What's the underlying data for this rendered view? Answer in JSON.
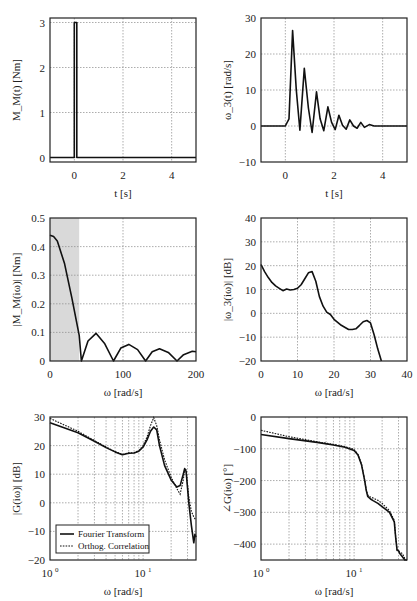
{
  "chart_data": [
    {
      "id": "torque-time",
      "type": "line",
      "xlabel": "t [s]",
      "ylabel": "M_M(t) [Nm]",
      "xlim": [
        -1,
        5
      ],
      "ylim": [
        -0.1,
        3.1
      ],
      "xticks": [
        0,
        2,
        4
      ],
      "yticks": [
        0,
        1,
        2,
        3
      ],
      "grid": true,
      "series": [
        {
          "name": "M_M(t)",
          "x": [
            -1,
            0,
            0,
            0.1,
            0.1,
            5
          ],
          "y": [
            0,
            0,
            3,
            3,
            0,
            0
          ]
        }
      ]
    },
    {
      "id": "speed-time",
      "type": "line",
      "xlabel": "t [s]",
      "ylabel": "ω_3(t) [rad/s]",
      "xlim": [
        -1,
        5
      ],
      "ylim": [
        -10,
        30
      ],
      "xticks": [
        0,
        2,
        4
      ],
      "yticks": [
        -10,
        0,
        10,
        20,
        30
      ],
      "grid": true,
      "series": [
        {
          "name": "ω_3(t)",
          "x": [
            -1,
            0,
            0.15,
            0.3,
            0.45,
            0.6,
            0.78,
            0.95,
            1.1,
            1.28,
            1.43,
            1.58,
            1.75,
            1.9,
            2.05,
            2.2,
            2.35,
            2.5,
            2.65,
            2.8,
            2.95,
            3.1,
            3.25,
            3.45,
            3.65,
            5
          ],
          "y": [
            0,
            0,
            2,
            26.5,
            10,
            -1.2,
            16,
            5,
            -1.8,
            9.5,
            2,
            -1.3,
            5.3,
            1,
            -1,
            3,
            0.2,
            -0.9,
            1.7,
            0,
            -0.6,
            1,
            -0.4,
            0.4,
            0,
            0
          ]
        }
      ]
    },
    {
      "id": "torque-spectrum",
      "type": "line",
      "xlabel": "ω [rad/s]",
      "ylabel": "|M_M(iω)| [Nm]",
      "xlim": [
        0,
        200
      ],
      "ylim": [
        0,
        0.5
      ],
      "xticks": [
        0,
        100,
        200
      ],
      "yticks": [
        0,
        0.1,
        0.2,
        0.3,
        0.4,
        0.5
      ],
      "grid": true,
      "shaded_region": [
        0,
        40
      ],
      "series": [
        {
          "name": "|M_M(iω)|",
          "x": [
            0,
            5,
            10,
            20,
            30,
            40,
            43,
            52,
            63,
            75,
            87,
            97,
            108,
            120,
            131,
            140,
            150,
            162,
            174,
            183,
            195,
            200
          ],
          "y": [
            0.44,
            0.435,
            0.42,
            0.34,
            0.22,
            0.09,
            0.0,
            0.07,
            0.097,
            0.06,
            0.0,
            0.045,
            0.058,
            0.04,
            0.0,
            0.032,
            0.043,
            0.03,
            0.0,
            0.022,
            0.034,
            0.032
          ]
        }
      ]
    },
    {
      "id": "speed-spectrum",
      "type": "line",
      "xlabel": "ω [rad/s]",
      "ylabel": "|ω_3(iω)| [dB]",
      "xlim": [
        0,
        40
      ],
      "ylim": [
        -20,
        40
      ],
      "xticks": [
        0,
        10,
        20,
        30,
        40
      ],
      "yticks": [
        -20,
        -10,
        0,
        10,
        20,
        30,
        40
      ],
      "grid": true,
      "series": [
        {
          "name": "|ω_3(iω)|",
          "x": [
            0,
            1,
            2,
            3,
            4,
            5,
            6,
            7,
            8,
            9,
            10,
            11,
            12,
            13,
            14,
            15,
            16,
            17,
            18,
            19,
            20,
            22,
            24,
            25,
            26,
            27,
            28,
            29,
            30,
            31,
            32,
            33
          ],
          "y": [
            20.5,
            17.5,
            15,
            13,
            11.5,
            10.5,
            9.5,
            10.2,
            9.8,
            10,
            10.5,
            12,
            14.5,
            17,
            17.5,
            13.5,
            7,
            3,
            0.5,
            -0.5,
            -2.5,
            -5,
            -6.8,
            -6.8,
            -6.5,
            -5,
            -3.5,
            -3,
            -4,
            -9,
            -15,
            -20
          ]
        }
      ]
    },
    {
      "id": "bode-magnitude",
      "type": "line",
      "xscale": "log",
      "xlabel": "ω [rad/s]",
      "ylabel": "|G(iω)| [dB]",
      "xlim": [
        1,
        37
      ],
      "ylim": [
        -20,
        30
      ],
      "xticks": [
        "10^0",
        "10^1"
      ],
      "yticks": [
        -20,
        -10,
        0,
        10,
        20,
        30
      ],
      "grid": true,
      "legend": {
        "position": "lower left",
        "entries": [
          "Fourier Transform",
          "Orthog. Correlation"
        ]
      },
      "series": [
        {
          "name": "Fourier Transform",
          "style": "solid",
          "x": [
            1,
            2,
            3,
            4,
            5,
            6,
            7,
            8,
            9,
            10,
            11,
            12,
            13,
            14,
            15,
            17,
            20,
            23,
            25,
            27,
            28,
            29,
            31,
            33,
            35,
            36,
            37
          ],
          "y": [
            28,
            24.5,
            21.5,
            19.3,
            17.8,
            16.8,
            17.3,
            17.4,
            18,
            19.5,
            22,
            25,
            26.5,
            25.5,
            20,
            13,
            8,
            5.5,
            6,
            10,
            12,
            11,
            0,
            -8,
            -14,
            -11,
            -12
          ]
        },
        {
          "name": "Orthog. Correlation",
          "style": "dotted",
          "x": [
            1,
            2,
            3,
            4,
            5,
            6,
            7,
            8,
            9,
            10,
            11,
            12,
            13,
            14,
            15,
            17,
            20,
            23,
            25,
            27,
            28,
            29,
            31,
            33,
            35,
            37
          ],
          "y": [
            29.5,
            25,
            21.8,
            19.5,
            17.9,
            16.9,
            17.5,
            17.5,
            18.3,
            20,
            23,
            27,
            29.8,
            27,
            22,
            15,
            9,
            5,
            3,
            8,
            11.5,
            11.5,
            2,
            -3,
            -5,
            -6
          ]
        }
      ]
    },
    {
      "id": "bode-phase",
      "type": "line",
      "xscale": "log",
      "xlabel": "ω [rad/s]",
      "ylabel": "∠G(iω) [°]",
      "xlim": [
        1,
        37
      ],
      "ylim": [
        -450,
        0
      ],
      "xticks": [
        "10^0",
        "10^1"
      ],
      "yticks": [
        -400,
        -300,
        -200,
        -100,
        0
      ],
      "grid": true,
      "series": [
        {
          "name": "Fourier Transform",
          "style": "solid",
          "x": [
            1,
            2,
            4,
            6,
            8,
            10,
            11,
            12,
            13,
            13.5,
            14,
            15,
            16,
            18,
            20,
            24,
            27,
            28,
            29,
            30,
            31,
            33,
            35,
            37
          ],
          "y": [
            -55,
            -68,
            -80,
            -88,
            -95,
            -105,
            -120,
            -150,
            -200,
            -230,
            -250,
            -258,
            -263,
            -272,
            -282,
            -300,
            -330,
            -380,
            -420,
            -420,
            -430,
            -440,
            -450,
            -450
          ]
        },
        {
          "name": "Orthog. Correlation",
          "style": "dotted",
          "x": [
            1,
            2,
            4,
            6,
            8,
            10,
            11,
            12,
            13,
            13.5,
            14,
            15,
            16,
            18,
            20,
            24,
            27,
            28,
            29,
            30,
            31,
            33,
            35,
            37
          ],
          "y": [
            -42,
            -62,
            -78,
            -86,
            -93,
            -102,
            -118,
            -148,
            -198,
            -228,
            -245,
            -252,
            -255,
            -262,
            -272,
            -295,
            -325,
            -378,
            -418,
            -422,
            -425,
            -430,
            -445,
            -450
          ]
        }
      ]
    }
  ],
  "labels": {
    "p1": {
      "ylabel": "M_M(t) [Nm]",
      "xlabel": "t [s]",
      "yticks": [
        "0",
        "1",
        "2",
        "3"
      ],
      "xticks": [
        "0",
        "2",
        "4"
      ]
    },
    "p2": {
      "ylabel": "ω_3(t) [rad/s]",
      "xlabel": "t [s]",
      "yticks": [
        "−10",
        "0",
        "10",
        "20",
        "30"
      ],
      "xticks": [
        "0",
        "2",
        "4"
      ]
    },
    "p3": {
      "ylabel": "|M_M(iω)| [Nm]",
      "xlabel": "ω [rad/s]",
      "yticks": [
        "0",
        "0.1",
        "0.2",
        "0.3",
        "0.4",
        "0.5"
      ],
      "xticks": [
        "0",
        "100",
        "200"
      ]
    },
    "p4": {
      "ylabel": "|ω_3(iω)| [dB]",
      "xlabel": "ω [rad/s]",
      "yticks": [
        "−20",
        "−10",
        "0",
        "10",
        "20",
        "30",
        "40"
      ],
      "xticks": [
        "0",
        "10",
        "20",
        "30",
        "40"
      ]
    },
    "p5": {
      "ylabel": "|G(iω)| [dB]",
      "xlabel": "ω [rad/s]",
      "yticks": [
        "−20",
        "−10",
        "0",
        "10",
        "20",
        "30"
      ],
      "xticks": [
        "10",
        "10"
      ],
      "xexp": [
        "0",
        "1"
      ],
      "legend": [
        "Fourier Transform",
        "Orthog. Correlation"
      ]
    },
    "p6": {
      "ylabel": "∠G(iω) [°]",
      "xlabel": "ω [rad/s]",
      "yticks": [
        "−400",
        "−300",
        "−200",
        "−100",
        "0"
      ],
      "xticks": [
        "10",
        "10"
      ],
      "xexp": [
        "0",
        "1"
      ]
    }
  }
}
